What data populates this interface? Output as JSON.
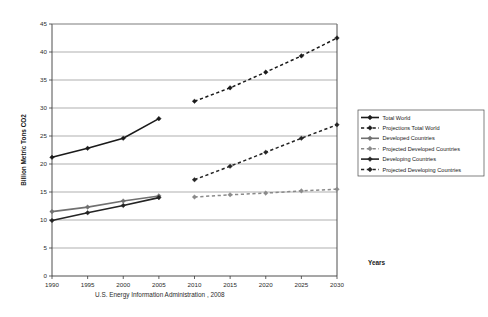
{
  "chart_data": {
    "type": "line",
    "title": "",
    "xlabel": "Years",
    "ylabel": "Billion Metric Tons CO2",
    "xlim": [
      1990,
      2030
    ],
    "ylim": [
      0,
      45
    ],
    "ytick_step": 5,
    "xtick_step": 5,
    "grid": "horizontal",
    "legend_position": "right",
    "xticks": [
      "1990",
      "1995",
      "2000",
      "2005",
      "2010",
      "2015",
      "2020",
      "2025",
      "2030"
    ],
    "yticks": [
      "0",
      "5",
      "10",
      "15",
      "20",
      "25",
      "30",
      "35",
      "40",
      "45"
    ],
    "caption": "U.S. Energy Information Administration , 2008",
    "series": [
      {
        "name": "Total World",
        "style": "solid",
        "color": "#1a1a1a",
        "marker": "diamond",
        "x": [
          1990,
          1995,
          2000,
          2005
        ],
        "values": [
          21.2,
          22.8,
          24.6,
          28.1
        ]
      },
      {
        "name": "Projections Total World",
        "style": "dashed",
        "color": "#1a1a1a",
        "marker": "diamond",
        "x": [
          2010,
          2015,
          2020,
          2025,
          2030
        ],
        "values": [
          31.2,
          33.6,
          36.4,
          39.3,
          42.5
        ]
      },
      {
        "name": "Developed Countries",
        "style": "solid",
        "color": "#707070",
        "marker": "diamond",
        "x": [
          1990,
          1995,
          2000,
          2005
        ],
        "values": [
          11.5,
          12.3,
          13.4,
          14.3
        ]
      },
      {
        "name": "Projected Developed Countries",
        "style": "dashed",
        "color": "#8a8a8a",
        "marker": "diamond",
        "x": [
          2010,
          2015,
          2020,
          2025,
          2030
        ],
        "values": [
          14.1,
          14.5,
          14.8,
          15.2,
          15.5
        ]
      },
      {
        "name": "Developing Countries",
        "style": "solid",
        "color": "#242424",
        "marker": "diamond",
        "x": [
          1990,
          1995,
          2000,
          2005
        ],
        "values": [
          9.9,
          11.3,
          12.6,
          14.0
        ]
      },
      {
        "name": "Projected Developing Countries",
        "style": "dashed",
        "color": "#242424",
        "marker": "diamond",
        "x": [
          2010,
          2015,
          2020,
          2025,
          2030
        ],
        "values": [
          17.2,
          19.6,
          22.1,
          24.6,
          27.0
        ]
      }
    ]
  },
  "legend": {
    "items": [
      {
        "label": "Total World"
      },
      {
        "label": "Projections Total World"
      },
      {
        "label": "Developed Countries"
      },
      {
        "label": "Projected Developed Countries"
      },
      {
        "label": "Developing Countries"
      },
      {
        "label": "Projected Developing Countries"
      }
    ]
  }
}
